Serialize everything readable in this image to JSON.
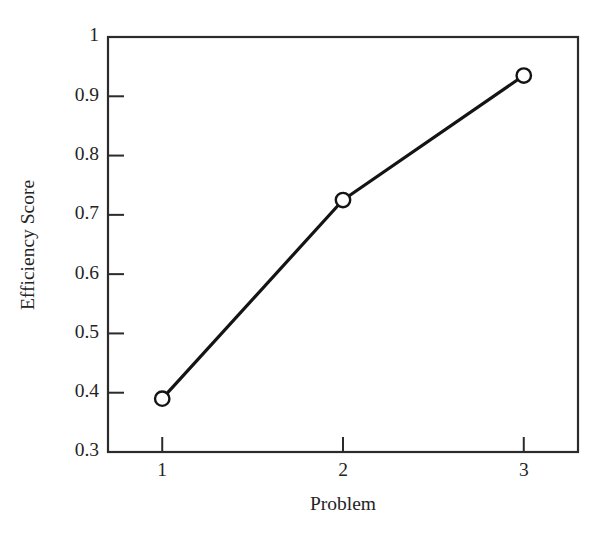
{
  "chart_data": {
    "type": "line",
    "title": "",
    "subtitle": "",
    "xlabel": "Problem",
    "ylabel": "Efficiency Score",
    "x": [
      1,
      2,
      3
    ],
    "categories": [
      "1",
      "2",
      "3"
    ],
    "values": [
      0.39,
      0.725,
      0.935
    ],
    "series": [
      {
        "name": "Efficiency Score",
        "values": [
          0.39,
          0.725,
          0.935
        ]
      }
    ],
    "xlim": [
      0.7,
      3.3
    ],
    "ylim": [
      0.3,
      1.0
    ],
    "xticks": [
      1,
      2,
      3
    ],
    "xtick_labels": [
      "1",
      "2",
      "3"
    ],
    "yticks": [
      0.3,
      0.4,
      0.5,
      0.6,
      0.7,
      0.8,
      0.9,
      1.0
    ],
    "ytick_labels": [
      "0.3",
      "0.4",
      "0.5",
      "0.6",
      "0.7",
      "0.8",
      "0.9",
      "1"
    ],
    "grid": false,
    "legend": false,
    "legend_position": "none",
    "marker": "open-circle",
    "line_color": "#141414",
    "marker_face_color": "#ffffff",
    "marker_edge_color": "#141414",
    "axis_color": "#2b2b2b",
    "background_color": "#ffffff",
    "annotations": []
  },
  "axes": {
    "y_tick_labels": [
      {
        "text": "1",
        "value": 1.0
      },
      {
        "text": "0.9",
        "value": 0.9
      },
      {
        "text": "0.8",
        "value": 0.8
      },
      {
        "text": "0.7",
        "value": 0.7
      },
      {
        "text": "0.6",
        "value": 0.6
      },
      {
        "text": "0.5",
        "value": 0.5
      },
      {
        "text": "0.4",
        "value": 0.4
      },
      {
        "text": "0.3",
        "value": 0.3
      }
    ],
    "x_tick_labels": [
      {
        "text": "1",
        "value": 1
      },
      {
        "text": "2",
        "value": 2
      },
      {
        "text": "3",
        "value": 3
      }
    ],
    "y_axis_title": "Efficiency Score",
    "x_axis_title": "Problem"
  },
  "points": [
    {
      "label": "point-1",
      "x": 1,
      "y": 0.39
    },
    {
      "label": "point-2",
      "x": 2,
      "y": 0.725
    },
    {
      "label": "point-3",
      "x": 3,
      "y": 0.935
    }
  ]
}
